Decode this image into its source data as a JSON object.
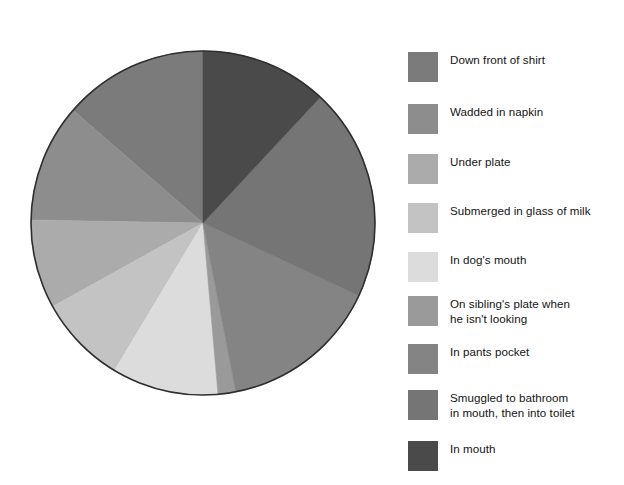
{
  "chart_data": {
    "type": "pie",
    "title": "",
    "subtitle": "",
    "xlabel": "",
    "ylabel": "",
    "legend_position": "right",
    "grid": false,
    "start_angle_deg": -90,
    "direction": "counterclockwise",
    "categories": [
      "Down front of shirt",
      "Wadded in napkin",
      "Under plate",
      "Submerged in glass of milk",
      "In dog's mouth",
      "On sibling's plate when\nhe isn't looking",
      "In pants pocket",
      "Smuggled to bathroom\nin mouth, then into toilet",
      "In mouth"
    ],
    "values": [
      13.6,
      11.1,
      8.3,
      8.3,
      10.0,
      1.7,
      15.0,
      20.0,
      12.0
    ],
    "angles_deg": [
      49,
      40,
      30,
      30,
      36,
      6,
      54,
      72,
      43
    ],
    "colors": [
      "#7b7b7b",
      "#8d8d8d",
      "#ababab",
      "#c3c3c3",
      "#dcdcdc",
      "#9a9a9a",
      "#848484",
      "#757575",
      "#4a4a4a"
    ],
    "series": [
      {
        "name": "Where the vegetables went",
        "values": [
          13.6,
          11.1,
          8.3,
          8.3,
          10.0,
          1.7,
          15.0,
          20.0,
          12.0
        ]
      }
    ]
  },
  "legend": {
    "items": [
      {
        "label": "Down front of shirt",
        "color": "#7b7b7b",
        "swatch": "legend-swatch-down-front-of-shirt"
      },
      {
        "label": "Wadded in napkin",
        "color": "#8d8d8d",
        "swatch": "legend-swatch-wadded-in-napkin"
      },
      {
        "label": "Under plate",
        "color": "#ababab",
        "swatch": "legend-swatch-under-plate"
      },
      {
        "label": "Submerged in glass of milk",
        "color": "#c3c3c3",
        "swatch": "legend-swatch-submerged-in-glass-of-milk"
      },
      {
        "label": "In dog's mouth",
        "color": "#dcdcdc",
        "swatch": "legend-swatch-in-dogs-mouth"
      },
      {
        "label": "On sibling's plate when\nhe isn't looking",
        "color": "#9a9a9a",
        "swatch": "legend-swatch-on-siblings-plate"
      },
      {
        "label": "In pants pocket",
        "color": "#848484",
        "swatch": "legend-swatch-in-pants-pocket"
      },
      {
        "label": "Smuggled to bathroom\nin mouth, then into toilet",
        "color": "#757575",
        "swatch": "legend-swatch-smuggled-to-bathroom"
      },
      {
        "label": "In mouth",
        "color": "#4a4a4a",
        "swatch": "legend-swatch-in-mouth"
      }
    ],
    "row_tops": [
      28,
      80,
      130,
      179,
      228,
      272,
      320,
      366,
      417
    ]
  },
  "pie": {
    "center_x": 179,
    "center_y": 179,
    "radius": 172,
    "outline_color": "#2e2e2e"
  }
}
